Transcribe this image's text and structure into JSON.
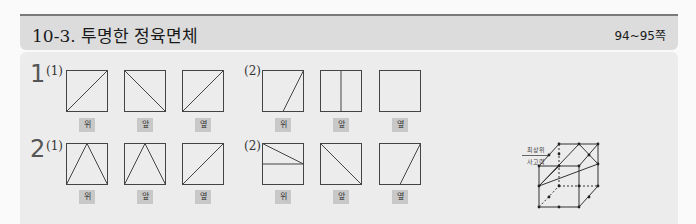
{
  "header": {
    "title": "10-3. 투명한 정육면체",
    "pages": "94~95쪽"
  },
  "problems": [
    {
      "number": "1",
      "parts": [
        {
          "label": "(1)",
          "views": [
            {
              "name": "위",
              "lines": "diag-up"
            },
            {
              "name": "앞",
              "lines": "diag-down"
            },
            {
              "name": "옆",
              "lines": "diag-up"
            }
          ]
        },
        {
          "label": "(2)",
          "views": [
            {
              "name": "위",
              "lines": "slant-bottom-mid-to-top-right"
            },
            {
              "name": "앞",
              "lines": "vertical-middle"
            },
            {
              "name": "옆",
              "lines": "none"
            }
          ]
        }
      ]
    },
    {
      "number": "2",
      "parts": [
        {
          "label": "(1)",
          "views": [
            {
              "name": "위",
              "lines": "triangle-apex-top"
            },
            {
              "name": "앞",
              "lines": "triangle-apex-top"
            },
            {
              "name": "옆",
              "lines": "diag-up"
            }
          ]
        },
        {
          "label": "(2)",
          "views": [
            {
              "name": "위",
              "lines": "horizontal-middle-plus-diag"
            },
            {
              "name": "앞",
              "lines": "diag-down"
            },
            {
              "name": "옆",
              "lines": "slant-bottom-mid-to-top-right"
            }
          ]
        }
      ]
    }
  ],
  "legend": {
    "top": "최상위",
    "bottom": "사고력"
  }
}
